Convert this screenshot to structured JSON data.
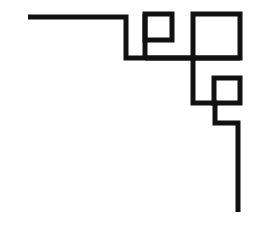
{
  "artwork": {
    "title": "Geometric Corner Ornament",
    "description": "Black line-art decorative corner border composed of a stepped polyline with three nested open squares",
    "style": "line-art",
    "orientation": "top-left-to-bottom-right corner",
    "canvas": {
      "width": 265,
      "height": 225,
      "background_color": "#ffffff"
    },
    "ink": {
      "color": "#111111",
      "stroke_width": 5
    },
    "figures": [
      {
        "id": "stepped-polyline",
        "name": "stepped-border-path",
        "kind": "polyline",
        "stroke_width": 5,
        "color": "#111111",
        "points": [
          [
            28,
            17
          ],
          [
            126,
            17
          ],
          [
            126,
            58
          ],
          [
            193,
            58
          ],
          [
            193,
            103
          ],
          [
            215,
            103
          ],
          [
            215,
            123
          ],
          [
            238,
            123
          ],
          [
            238,
            212
          ]
        ]
      },
      {
        "id": "connector-vertical-left",
        "name": "small-square-left-stem",
        "kind": "polyline",
        "stroke_width": 5,
        "color": "#111111",
        "points": [
          [
            145,
            14
          ],
          [
            145,
            58
          ]
        ]
      },
      {
        "id": "connector-horizontal-mid",
        "name": "mid-horizontal-rail",
        "kind": "polyline",
        "stroke_width": 5,
        "color": "#111111",
        "points": [
          [
            145,
            58
          ],
          [
            240,
            58
          ]
        ]
      },
      {
        "id": "square-small",
        "name": "small-square",
        "kind": "rect",
        "stroke_width": 5,
        "color": "#111111",
        "x": 145,
        "y": 14,
        "width": 27,
        "height": 26,
        "size_label": "small"
      },
      {
        "id": "square-large",
        "name": "large-square",
        "kind": "rect",
        "stroke_width": 5,
        "color": "#111111",
        "x": 193,
        "y": 14,
        "width": 47,
        "height": 44,
        "size_label": "large"
      },
      {
        "id": "square-medium",
        "name": "medium-square",
        "kind": "rect",
        "stroke_width": 5,
        "color": "#111111",
        "x": 214,
        "y": 78,
        "width": 26,
        "height": 25,
        "size_label": "medium"
      }
    ]
  }
}
